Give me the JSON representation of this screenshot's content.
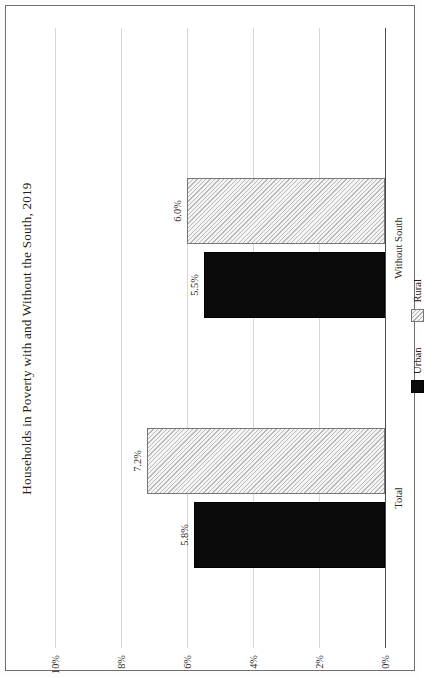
{
  "chart_data": {
    "type": "bar",
    "orientation": "horizontal",
    "title": "Households in Poverty with and Without the South, 2019",
    "xlabel": "",
    "ylabel": "",
    "categories": [
      "Total",
      "Without South"
    ],
    "series": [
      {
        "name": "Urban",
        "values": [
          5.8,
          6.0
        ],
        "color": "#0a0a0a",
        "fill": "solid"
      },
      {
        "name": "Rural",
        "values": [
          7.2,
          6.0
        ],
        "color": "#f1f1f1",
        "fill": "diagonal-hatch"
      }
    ],
    "data_labels": {
      "Total": {
        "Urban": "5.8%",
        "Rural": "7.2%"
      },
      "Without South": {
        "Urban": "5.5%",
        "Rural": "6.0%"
      }
    },
    "values_plot": {
      "Total": {
        "Urban": 5.8,
        "Rural": 7.2
      },
      "Without South": {
        "Urban": 5.5,
        "Rural": 6.0
      }
    },
    "tick_labels": [
      "0%",
      "2%",
      "4%",
      "6%",
      "8%",
      "10%"
    ],
    "tick_values": [
      0,
      2,
      4,
      6,
      8,
      10
    ],
    "axis_range": [
      0,
      10
    ],
    "grid": true,
    "legend_position": "center",
    "legend_entries": [
      "Urban",
      "Rural"
    ]
  },
  "legend": {
    "urban_label": "Urban",
    "rural_label": "Rural"
  }
}
